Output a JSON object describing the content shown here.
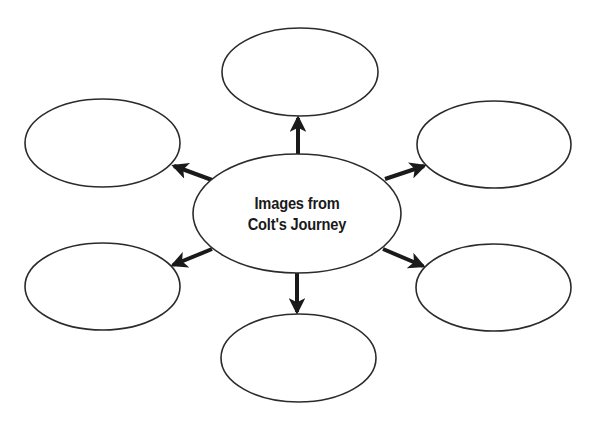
{
  "diagram": {
    "type": "web-organizer",
    "center": {
      "line1": "Images from",
      "line2": "Colt's Journey"
    },
    "outer_nodes": [
      {
        "position": "top",
        "text": ""
      },
      {
        "position": "top-left",
        "text": ""
      },
      {
        "position": "top-right",
        "text": ""
      },
      {
        "position": "bottom-left",
        "text": ""
      },
      {
        "position": "bottom-right",
        "text": ""
      },
      {
        "position": "bottom",
        "text": ""
      }
    ],
    "colors": {
      "stroke": "#2b2b2b",
      "arrow": "#1a1a1a",
      "background": "#ffffff"
    }
  }
}
